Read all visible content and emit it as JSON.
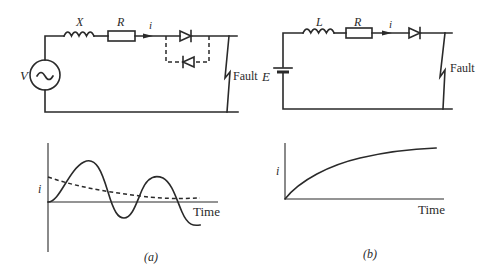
{
  "figure": {
    "panel_a": {
      "caption": "(a)",
      "circuit": {
        "source_label": "V",
        "source_icon": "ac-source-icon",
        "inductor_label": "X",
        "resistor_label": "R",
        "current_label": "i",
        "fault_label": "Fault",
        "components": [
          "ac-voltage-source",
          "inductor",
          "resistor",
          "diode",
          "antiparallel-diode-dashed",
          "fault"
        ]
      },
      "waveform": {
        "y_label": "i",
        "x_label": "Time",
        "curves": [
          "oscillating-decaying-offset (solid)",
          "decaying-dc-component (dashed)"
        ]
      }
    },
    "panel_b": {
      "caption": "(b)",
      "circuit": {
        "source_label": "E",
        "source_icon": "battery-icon",
        "inductor_label": "L",
        "resistor_label": "R",
        "current_label": "i",
        "fault_label": "Fault",
        "components": [
          "dc-battery",
          "inductor",
          "resistor",
          "diode",
          "fault"
        ]
      },
      "waveform": {
        "y_label": "i",
        "x_label": "Time",
        "curves": [
          "exponential-rise (solid)"
        ]
      }
    },
    "colors": {
      "ink": "#2a2a2a",
      "background": "#ffffff"
    }
  }
}
